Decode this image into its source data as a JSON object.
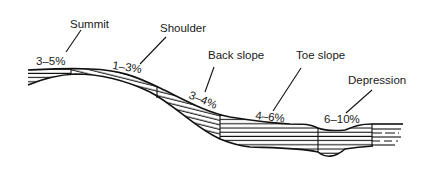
{
  "diagram": {
    "type": "hillslope-profile",
    "positions": [
      {
        "name": "Summit",
        "slope": "3–5%",
        "hatch": "horizontal"
      },
      {
        "name": "Shoulder",
        "slope": "1–3%",
        "hatch": "diagonal"
      },
      {
        "name": "Back slope",
        "slope": "3–4%",
        "hatch": "diagonal"
      },
      {
        "name": "Toe slope",
        "slope": "4–6%",
        "hatch": "horizontal"
      },
      {
        "name": "Depression",
        "slope": "6–10%",
        "hatch": "horizontal"
      }
    ]
  },
  "colors": {
    "ink": "#111111",
    "background": "#ffffff"
  }
}
